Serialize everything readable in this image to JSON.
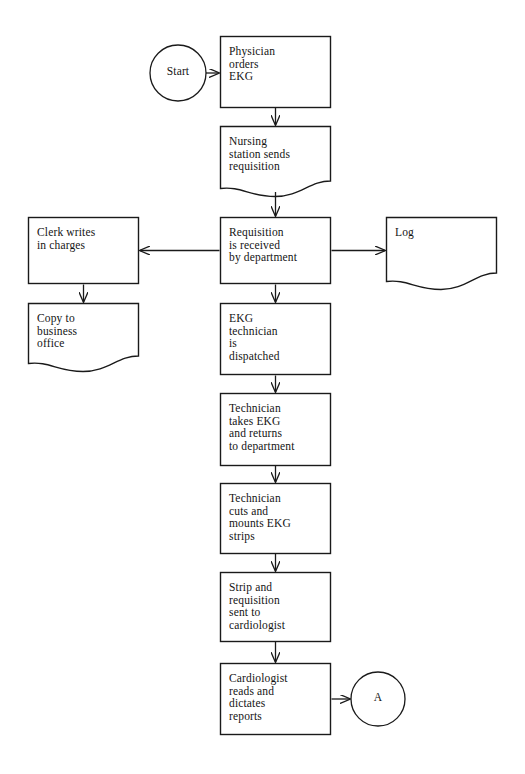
{
  "diagram": {
    "stroke_color": "#1a1a1a",
    "fill_color": "#ffffff",
    "background": "#ffffff"
  },
  "nodes": [
    {
      "id": "start",
      "shape": "circle",
      "label": "Start",
      "x": 150,
      "y": 45,
      "w": 56,
      "h": 56
    },
    {
      "id": "physician-orders-ekg",
      "shape": "process",
      "label": "Physician\norders\nEKG",
      "x": 220,
      "y": 36,
      "w": 111,
      "h": 72
    },
    {
      "id": "nursing-station-sends-requisition",
      "shape": "document",
      "label": "Nursing\nstation sends\nrequisition",
      "x": 220,
      "y": 126,
      "w": 111,
      "h": 70
    },
    {
      "id": "clerk-writes-in-charges",
      "shape": "process",
      "label": "Clerk writes\nin charges",
      "x": 28,
      "y": 217,
      "w": 111,
      "h": 67
    },
    {
      "id": "requisition-is-received",
      "shape": "process",
      "label": "Requisition\nis received\nby department",
      "x": 220,
      "y": 217,
      "w": 111,
      "h": 67
    },
    {
      "id": "log",
      "shape": "document",
      "label": "Log",
      "x": 386,
      "y": 217,
      "w": 111,
      "h": 72
    },
    {
      "id": "copy-to-business-office",
      "shape": "document",
      "label": "Copy to\nbusiness\noffice",
      "x": 28,
      "y": 303,
      "w": 111,
      "h": 68
    },
    {
      "id": "ekg-technician-is-dispatched",
      "shape": "process",
      "label": "EKG\ntechnician\nis\ndispatched",
      "x": 220,
      "y": 303,
      "w": 111,
      "h": 72
    },
    {
      "id": "technician-takes-ekg",
      "shape": "process",
      "label": "Technician\ntakes EKG\nand returns\nto department",
      "x": 220,
      "y": 393,
      "w": 111,
      "h": 73
    },
    {
      "id": "technician-cuts-and-mounts",
      "shape": "process",
      "label": "Technician\ncuts and\nmounts EKG\nstrips",
      "x": 220,
      "y": 483,
      "w": 111,
      "h": 71
    },
    {
      "id": "strip-and-requisition-sent",
      "shape": "process",
      "label": "Strip and\nrequisition\nsent to\ncardiologist",
      "x": 220,
      "y": 572,
      "w": 111,
      "h": 70
    },
    {
      "id": "cardiologist-reads-and-dictates",
      "shape": "process",
      "label": "Cardiologist\nreads and\ndictates\nreports",
      "x": 220,
      "y": 663,
      "w": 111,
      "h": 72
    },
    {
      "id": "connector-a",
      "shape": "circle",
      "label": "A",
      "x": 351,
      "y": 672,
      "w": 54,
      "h": 54
    }
  ],
  "connectors": [
    {
      "id": "start-to-physician",
      "from": "start",
      "to": "physician-orders-ekg",
      "direction": "right"
    },
    {
      "id": "physician-to-nursing",
      "from": "physician-orders-ekg",
      "to": "nursing-station-sends-requisition",
      "direction": "down"
    },
    {
      "id": "nursing-to-requisition",
      "from": "nursing-station-sends-requisition",
      "to": "requisition-is-received",
      "direction": "down"
    },
    {
      "id": "requisition-to-clerk",
      "from": "requisition-is-received",
      "to": "clerk-writes-in-charges",
      "direction": "left"
    },
    {
      "id": "requisition-to-log",
      "from": "requisition-is-received",
      "to": "log",
      "direction": "right"
    },
    {
      "id": "clerk-to-copy",
      "from": "clerk-writes-in-charges",
      "to": "copy-to-business-office",
      "direction": "down"
    },
    {
      "id": "requisition-to-technician-dispatched",
      "from": "requisition-is-received",
      "to": "ekg-technician-is-dispatched",
      "direction": "down"
    },
    {
      "id": "dispatched-to-takes-ekg",
      "from": "ekg-technician-is-dispatched",
      "to": "technician-takes-ekg",
      "direction": "down"
    },
    {
      "id": "takes-ekg-to-cuts",
      "from": "technician-takes-ekg",
      "to": "technician-cuts-and-mounts",
      "direction": "down"
    },
    {
      "id": "cuts-to-strip",
      "from": "technician-cuts-and-mounts",
      "to": "strip-and-requisition-sent",
      "direction": "down"
    },
    {
      "id": "strip-to-cardiologist",
      "from": "strip-and-requisition-sent",
      "to": "cardiologist-reads-and-dictates",
      "direction": "down"
    },
    {
      "id": "cardiologist-to-connector-a",
      "from": "cardiologist-reads-and-dictates",
      "to": "connector-a",
      "direction": "right"
    }
  ],
  "labels": {
    "start": "Start",
    "physician": "Physician\norders\nEKG",
    "nursing": "Nursing\nstation sends\nrequisition",
    "clerk": "Clerk writes\nin charges",
    "requisition": "Requisition\nis received\nby department",
    "log": "Log",
    "copy": "Copy to\nbusiness\noffice",
    "dispatched": "EKG\ntechnician\nis\ndispatched",
    "takes": "Technician\ntakes EKG\nand returns\nto department",
    "cuts": "Technician\ncuts and\nmounts EKG\nstrips",
    "strip": "Strip and\nrequisition\nsent to\ncardiologist",
    "cardiologist": "Cardiologist\nreads and\ndictates\nreports",
    "connector_a": "A"
  }
}
